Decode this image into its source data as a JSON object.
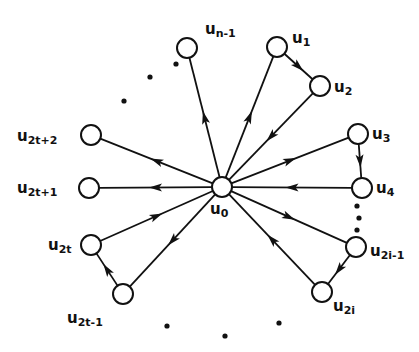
{
  "diagram": {
    "type": "directed-graph",
    "colors": {
      "ink": "#111111",
      "background": "#ffffff"
    },
    "node_radius": 10,
    "nodes": [
      {
        "id": "u0",
        "label": "u",
        "sub": "0",
        "x": 222,
        "y": 187,
        "lx": 210,
        "ly": 214
      },
      {
        "id": "un1",
        "label": "u",
        "sub": "n-1",
        "x": 187,
        "y": 48,
        "lx": 205,
        "ly": 34
      },
      {
        "id": "u1",
        "label": "u",
        "sub": "1",
        "x": 277,
        "y": 47,
        "lx": 292,
        "ly": 43
      },
      {
        "id": "u2",
        "label": "u",
        "sub": "2",
        "x": 320,
        "y": 86,
        "lx": 334,
        "ly": 92
      },
      {
        "id": "u3",
        "label": "u",
        "sub": "3",
        "x": 358,
        "y": 134,
        "lx": 372,
        "ly": 139
      },
      {
        "id": "u4",
        "label": "u",
        "sub": "4",
        "x": 362,
        "y": 188,
        "lx": 376,
        "ly": 193
      },
      {
        "id": "u2i1",
        "label": "u",
        "sub": "2i-1",
        "x": 356,
        "y": 247,
        "lx": 370,
        "ly": 256
      },
      {
        "id": "u2i",
        "label": "u",
        "sub": "2i",
        "x": 322,
        "y": 292,
        "lx": 333,
        "ly": 311
      },
      {
        "id": "u2t1",
        "label": "u",
        "sub": "2t-1",
        "x": 123,
        "y": 294,
        "lx": 67,
        "ly": 323
      },
      {
        "id": "u2t",
        "label": "u",
        "sub": "2t",
        "x": 91,
        "y": 245,
        "lx": 48,
        "ly": 250
      },
      {
        "id": "u2tp1",
        "label": "u",
        "sub": "2t+1",
        "x": 89,
        "y": 188,
        "lx": 17,
        "ly": 193
      },
      {
        "id": "u2tp2",
        "label": "u",
        "sub": "2t+2",
        "x": 91,
        "y": 135,
        "lx": 17,
        "ly": 141
      }
    ],
    "edges": [
      {
        "from": "u0",
        "to": "un1"
      },
      {
        "from": "u0",
        "to": "u1"
      },
      {
        "from": "u1",
        "to": "u2"
      },
      {
        "from": "u2",
        "to": "u0"
      },
      {
        "from": "u0",
        "to": "u3"
      },
      {
        "from": "u3",
        "to": "u4"
      },
      {
        "from": "u4",
        "to": "u0"
      },
      {
        "from": "u0",
        "to": "u2i1"
      },
      {
        "from": "u2i1",
        "to": "u2i"
      },
      {
        "from": "u2i",
        "to": "u0"
      },
      {
        "from": "u0",
        "to": "u2t1"
      },
      {
        "from": "u2t1",
        "to": "u2t"
      },
      {
        "from": "u2t",
        "to": "u0"
      },
      {
        "from": "u0",
        "to": "u2tp1"
      },
      {
        "from": "u0",
        "to": "u2tp2"
      }
    ],
    "ellipsis_dots": [
      {
        "x": 124,
        "y": 101
      },
      {
        "x": 150,
        "y": 77
      },
      {
        "x": 176,
        "y": 64
      },
      {
        "x": 357,
        "y": 206
      },
      {
        "x": 359,
        "y": 218
      },
      {
        "x": 357,
        "y": 230
      },
      {
        "x": 167,
        "y": 326
      },
      {
        "x": 225,
        "y": 336
      },
      {
        "x": 279,
        "y": 323
      }
    ]
  }
}
